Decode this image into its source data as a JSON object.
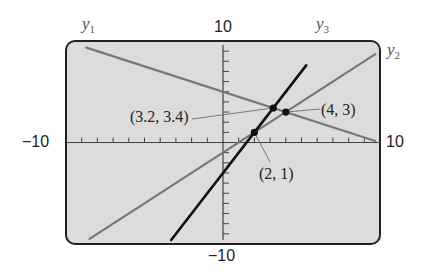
{
  "chart_data": {
    "type": "line",
    "title": "",
    "xlabel": "",
    "ylabel": "",
    "xlim": [
      -10,
      10
    ],
    "ylim": [
      -10,
      10
    ],
    "x_tick_step": 1,
    "y_tick_step": 1,
    "grid": false,
    "axis_labels": {
      "y_max": "10",
      "y_min": "−10",
      "x_min": "−10",
      "x_max": "10"
    },
    "series": [
      {
        "name": "y1",
        "name_base": "y",
        "name_sub": "1",
        "color": "#777777",
        "x": [
          -8.7,
          9.7
        ],
        "y": [
          9.35,
          0.15
        ]
      },
      {
        "name": "y2",
        "name_base": "y",
        "name_sub": "2",
        "color": "#777777",
        "x": [
          -8.5,
          9.7
        ],
        "y": [
          -9.5,
          8.7
        ]
      },
      {
        "name": "y3",
        "name_base": "y",
        "name_sub": "3",
        "color": "#111111",
        "x": [
          -3.3,
          5.3
        ],
        "y": [
          -9.6,
          7.6
        ]
      }
    ],
    "annotations": [
      {
        "label": "(3.2, 3.4)",
        "x": 3.2,
        "y": 3.4
      },
      {
        "label": "(4, 3)",
        "x": 4,
        "y": 3
      },
      {
        "label": "(2, 1)",
        "x": 2,
        "y": 1
      }
    ]
  },
  "screen": {
    "background": "#dcdcdc",
    "frame_color": "#222222"
  }
}
